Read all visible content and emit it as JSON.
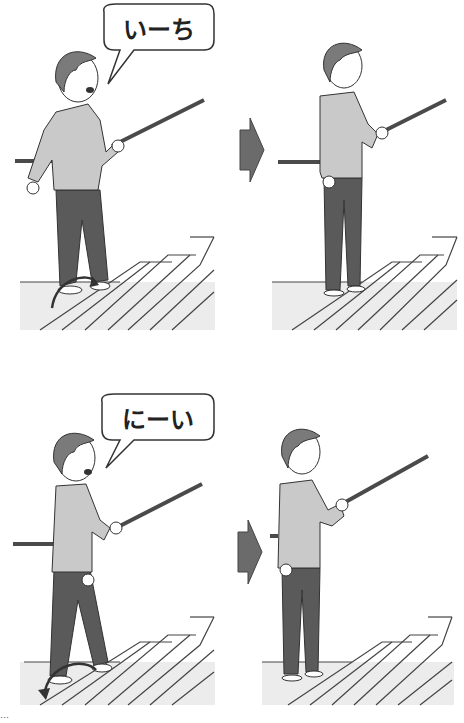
{
  "illustration": {
    "title": "Walking up stairs with a handrail, counting steps",
    "panels": [
      {
        "id": "step-1-action",
        "speech": "いーち",
        "description": "Person lifts foot onto step while holding handrail"
      },
      {
        "id": "step-1-result",
        "speech": "",
        "description": "Person standing on step holding handrail"
      },
      {
        "id": "step-2-action",
        "speech": "にーい",
        "description": "Person brings other foot up onto step"
      },
      {
        "id": "step-2-result",
        "speech": "",
        "description": "Person standing on step holding handrail"
      }
    ],
    "arrows": [
      {
        "icon": "right-arrow-icon"
      },
      {
        "icon": "right-arrow-icon"
      }
    ],
    "colors": {
      "arrow": "#6b6b6b",
      "shirt": "#c9c9c9",
      "pants": "#5a5a5a",
      "hair": "#7a7a7a",
      "rail": "#4a4a4a",
      "floor": "#ececec",
      "outline": "#333333"
    },
    "caption": "…"
  }
}
